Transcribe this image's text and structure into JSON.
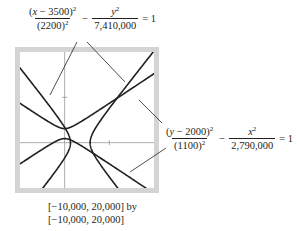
{
  "equation_1": {
    "num_expr": "(x − 3500)",
    "num_var": "x",
    "num_const": "3500",
    "num_exp": "2",
    "den": "(2200)",
    "den_exp": "2",
    "minus": "−",
    "num2": "y",
    "num2_exp": "2",
    "den2": "7,410,000",
    "equals": "= 1"
  },
  "equation_2": {
    "num_var": "y",
    "num_const": "2000",
    "num_exp": "2",
    "den": "(1100)",
    "den_exp": "2",
    "minus": "−",
    "num2": "x",
    "num2_exp": "2",
    "den2": "2,790,000",
    "equals": "= 1"
  },
  "window": {
    "line1": "[−10,000,  20,000] by",
    "line2": "[−10,000,  20,000]"
  },
  "plot": {
    "xmin": -10000,
    "xmax": 20000,
    "ymin": -10000,
    "ymax": 20000,
    "xscl": 10000,
    "yscl": 10000,
    "frame_color": "#d4d4d4",
    "curve_color": "#231f20",
    "axis_color": "#8a8a8a",
    "hyperbola_1": {
      "h": 3500,
      "k": 0,
      "a": 2200,
      "b2": 7410000,
      "orientation": "horizontal"
    },
    "hyperbola_2": {
      "h": 0,
      "k": 2000,
      "a": 1100,
      "b2": 2790000,
      "orientation": "vertical"
    }
  }
}
